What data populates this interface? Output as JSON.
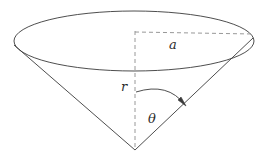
{
  "figure": {
    "background_color": "#ffffff",
    "stroke_color": "#3a3a3a",
    "dashed_color": "#8c8c8c",
    "label_color": "#2b2b2b",
    "labels": {
      "radius": "r",
      "axis_top": "a",
      "angle": "θ"
    },
    "geometry": {
      "ellipse": {
        "cx": 134,
        "cy": 41,
        "rx": 120,
        "ry": 30
      },
      "apex": {
        "x": 135,
        "y": 150
      },
      "rim_left": {
        "x": 14,
        "y": 45
      },
      "rim_right": {
        "x": 253,
        "y": 38
      },
      "center_top": {
        "x": 135,
        "y": 32
      },
      "arc_start": {
        "x": 136,
        "y": 92
      },
      "arc_end": {
        "x": 186,
        "y": 106
      }
    },
    "label_positions": {
      "radius": {
        "x": 124,
        "y": 87
      },
      "axis_top": {
        "x": 173,
        "y": 45
      },
      "angle": {
        "x": 152,
        "y": 119
      }
    }
  }
}
